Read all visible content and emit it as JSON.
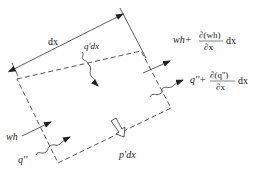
{
  "diagram": {
    "colors": {
      "line": "#333333",
      "background": "#ffffff"
    },
    "labels": {
      "dx": "dx",
      "lateral_inflow": "q'dx",
      "wh_in": "wh",
      "q_in": "q''",
      "wh_out_base": "wh+",
      "wh_out_num": "∂(wh)",
      "wh_out_den": "∂x",
      "wh_out_tail": "dx",
      "q_out_base": "q''+",
      "q_out_num": "∂(q'')",
      "q_out_den": "∂x",
      "q_out_tail": "dx",
      "pressure": "p'dx"
    },
    "element": {
      "shape": "dashed-parallelogram",
      "corners": [
        [
          17,
          79
        ],
        [
          141,
          51
        ],
        [
          171,
          108
        ],
        [
          58,
          163
        ]
      ]
    },
    "arrows": [
      {
        "name": "dimension-dx",
        "type": "double-arrow"
      },
      {
        "name": "lateral-inflow-q-prime",
        "type": "wavy-arrow",
        "direction": "down"
      },
      {
        "name": "wh-inflow",
        "type": "straight-arrow"
      },
      {
        "name": "q-double-prime-inflow",
        "type": "wavy-arrow"
      },
      {
        "name": "wh-outflow",
        "type": "straight-arrow"
      },
      {
        "name": "q-double-prime-outflow",
        "type": "wavy-arrow"
      },
      {
        "name": "pressure-p-prime",
        "type": "hollow-arrow",
        "direction": "down"
      }
    ]
  }
}
